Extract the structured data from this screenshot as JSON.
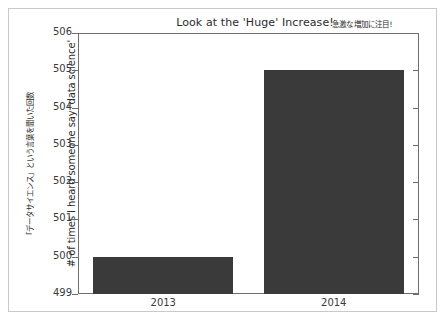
{
  "chart_data": {
    "type": "bar",
    "title": "Look at the 'Huge' Increase!",
    "title_annotation": "急激な増加に注目!",
    "xlabel": "",
    "ylabel": "# of times I heard someone say 'data science'",
    "ylabel_annotation": "「データサイエンス」という言葉を聞いた回数",
    "categories": [
      "2013",
      "2014"
    ],
    "values": [
      500,
      505
    ],
    "ylim": [
      499,
      506
    ],
    "yticks": [
      499,
      500,
      501,
      502,
      503,
      504,
      505,
      506
    ],
    "ytick_labels": [
      "499",
      "500",
      "501",
      "502",
      "503",
      "504",
      "505",
      "506"
    ],
    "grid": false,
    "legend": false,
    "bar_color": "#3b3a3a",
    "axis_color": "#6e6e6e",
    "background_color": "#ffffff",
    "text_color": "#2b2b2b"
  },
  "figure": {
    "frame_color": "#c9c9c9"
  }
}
